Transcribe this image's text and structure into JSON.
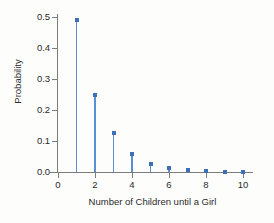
{
  "chart_data": {
    "type": "scatter",
    "title": "",
    "xlabel": "Number of Children until a Girl",
    "ylabel": "Probability",
    "x": [
      1,
      2,
      3,
      4,
      5,
      6,
      7,
      8,
      9,
      10
    ],
    "values": [
      0.49,
      0.25,
      0.125,
      0.058,
      0.027,
      0.013,
      0.006,
      0.003,
      0.0015,
      0.0008
    ],
    "series": [
      {
        "name": "Probability",
        "values": [
          0.49,
          0.25,
          0.125,
          0.058,
          0.027,
          0.013,
          0.006,
          0.003,
          0.0015,
          0.0008
        ]
      }
    ],
    "xlim": [
      0,
      10.5
    ],
    "ylim": [
      0.0,
      0.5
    ],
    "xticks": [
      0,
      2,
      4,
      6,
      8,
      10
    ],
    "xtick_labels": [
      "0",
      "2",
      "4",
      "6",
      "8",
      "10"
    ],
    "yticks": [
      0.0,
      0.1,
      0.2,
      0.3,
      0.4,
      0.5
    ],
    "ytick_labels": [
      "0.0",
      "0.1",
      "0.2",
      "0.3",
      "0.4",
      "0.5"
    ],
    "grid": false,
    "legend": false,
    "legend_position": "none",
    "marker_color": "#3d6fb8",
    "stem_color": "#5b8fd4",
    "axis_color": "#7d7d7d",
    "background_color": "#fdfdfc"
  }
}
